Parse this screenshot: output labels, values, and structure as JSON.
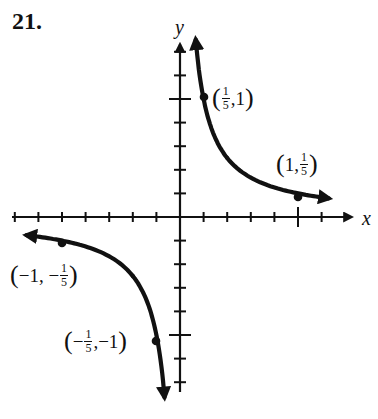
{
  "problem": {
    "number": "21."
  },
  "axes": {
    "x_label": "x",
    "y_label": "y"
  },
  "labels": {
    "p1": {
      "open": "(",
      "num": "1",
      "den": "5",
      "sep": ",",
      "rest": "1",
      "close": ")"
    },
    "p2": {
      "open": "(",
      "lead": "1,",
      "num": "1",
      "den": "5",
      "close": ")"
    },
    "p3": {
      "open": "(",
      "lead": "−1, −",
      "num": "1",
      "den": "5",
      "close": ")"
    },
    "p4": {
      "open": "(",
      "neg": "−",
      "num": "1",
      "den": "5",
      "sep": ",",
      "rest": "−1",
      "close": ")"
    }
  },
  "chart_data": {
    "type": "line",
    "title": "21.",
    "function": "y = 1/(5x)",
    "xlabel": "x",
    "ylabel": "y",
    "xlim": [
      -1.4,
      1.2
    ],
    "ylim": [
      -1.45,
      1.45
    ],
    "x_tick_spacing": 0.2,
    "y_tick_spacing": 0.2,
    "labeled_ticks": {
      "x": [
        1
      ],
      "y": [
        1,
        -1
      ]
    },
    "grid": false,
    "legend": null,
    "series": [
      {
        "name": "right branch (x > 0)",
        "points": [
          {
            "x": 0.15,
            "y": 1.333
          },
          {
            "x": 0.2,
            "y": 1.0,
            "label": "(1/5, 1)"
          },
          {
            "x": 0.4,
            "y": 0.5
          },
          {
            "x": 0.6,
            "y": 0.333
          },
          {
            "x": 1.0,
            "y": 0.2,
            "label": "(1, 1/5)"
          },
          {
            "x": 1.25,
            "y": 0.16
          }
        ]
      },
      {
        "name": "left branch (x < 0)",
        "points": [
          {
            "x": -1.3,
            "y": -0.154
          },
          {
            "x": -1.0,
            "y": -0.2,
            "label": "(-1, -1/5)"
          },
          {
            "x": -0.6,
            "y": -0.333
          },
          {
            "x": -0.4,
            "y": -0.5
          },
          {
            "x": -0.2,
            "y": -1.0,
            "label": "(-1/5, -1)"
          },
          {
            "x": -0.15,
            "y": -1.333
          }
        ]
      }
    ],
    "annotations": [
      "(1/5, 1)",
      "(1, 1/5)",
      "(-1, -1/5)",
      "(-1/5, -1)"
    ]
  }
}
